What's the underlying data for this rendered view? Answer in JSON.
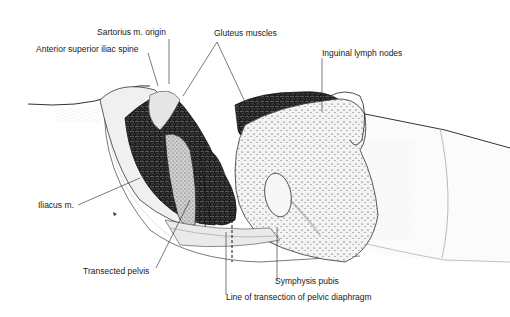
{
  "figure": {
    "type": "anatomical-illustration",
    "labels": {
      "sartorius": "Sartorius m. origin",
      "asis": "Anterior superior iliac spine",
      "gluteus": "Gluteus muscles",
      "inguinal": "Inguinal lymph nodes",
      "iliacus": "Iliacus m.",
      "pelvis": "Transected pelvis",
      "symphysis": "Symphysis pubis",
      "diaphragm": "Line of transection of pelvic diaphragm"
    },
    "colors": {
      "ink": "#111111",
      "muscle_dark": "#1c1c1c",
      "tissue_light": "#e8e8e8",
      "background": "#ffffff"
    }
  }
}
